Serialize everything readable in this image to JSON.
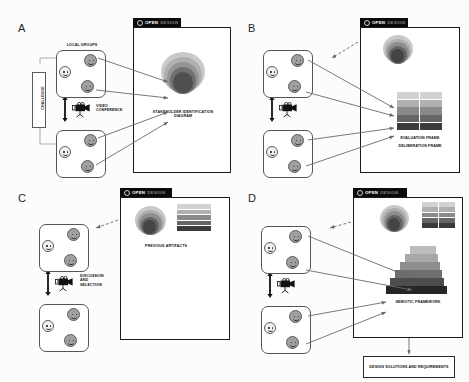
{
  "figure": {
    "background": "#fcfcfc",
    "ink": "#1a1a1a",
    "tab_bg": "#0b0b0b",
    "tab_word_1": "OPEN",
    "tab_word_2": "DESIGN",
    "tab_word_1_color": "#ffffff",
    "tab_word_2_color": "#7d7d7d"
  },
  "panels": [
    {
      "letter": "A",
      "window_title_1": "OPEN",
      "window_title_2": "DESIGN",
      "group_label": "LOCAL GROUPS",
      "challenge_label": "CHALLENGE",
      "conference_label": "VIDEO CONFERENCE",
      "artifact_caption": "STAKEHOLDER IDENTIFICATION DIAGRAM",
      "artifacts": [
        "onion"
      ]
    },
    {
      "letter": "B",
      "window_title_1": "OPEN",
      "window_title_2": "DESIGN",
      "group_label": "",
      "challenge_label": "",
      "conference_label": "",
      "artifact_caption": "EVALUATION FRAME",
      "artifact_caption_2": "DELIBERATION FRAME",
      "artifacts": [
        "onion",
        "grid"
      ]
    },
    {
      "letter": "C",
      "window_title_1": "OPEN",
      "window_title_2": "DESIGN",
      "group_label": "",
      "challenge_label": "",
      "conference_label": "DISCUSSION AND SELECTION",
      "artifact_caption": "PREVIOUS ARTIFACTS",
      "artifacts": [
        "onion",
        "grid"
      ]
    },
    {
      "letter": "D",
      "window_title_1": "OPEN",
      "window_title_2": "DESIGN",
      "group_label": "",
      "challenge_label": "",
      "conference_label": "",
      "artifact_caption": "SEMIOTIC FRAMEWORK",
      "output_box": "DESIGN SOLUTIONS AND REQUIREMENTS",
      "artifacts": [
        "onion",
        "grid",
        "stair"
      ]
    }
  ],
  "artifact_palette": {
    "onion_rings": [
      "#c9c9c9",
      "#b4b4b4",
      "#9a9a9a",
      "#7f7f7f",
      "#636363",
      "#4a4a4a"
    ],
    "grid_rows": [
      "#d2d2d2",
      "#b0b0b0",
      "#8a8a8a",
      "#666666",
      "#3b3b3b"
    ],
    "stair_steps": [
      "#bdbdbd",
      "#a8a8a8",
      "#8e8e8e",
      "#6e6e6e",
      "#4d4d4d",
      "#262626"
    ],
    "node_dark": "#a0a0a0",
    "node_light": "#f2f2f2"
  }
}
